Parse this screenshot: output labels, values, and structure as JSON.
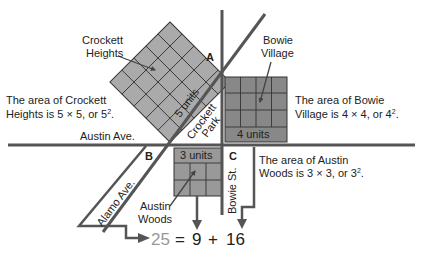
{
  "diagram": {
    "colors": {
      "road": "#555555",
      "crockett_square": "#aaaaaa",
      "bowie_square": "#888888",
      "austin_square": "#999999",
      "grid_line": "#333333",
      "equation_25": "#999999",
      "text": "#222222"
    },
    "regions": {
      "crockett_heights": {
        "name_line1": "Crockett",
        "name_line2": "Heights",
        "side_label": "5 units",
        "grid": 5
      },
      "bowie_village": {
        "name_line1": "Bowie",
        "name_line2": "Village",
        "side_label": "4 units",
        "grid": 4
      },
      "austin_woods": {
        "name_line1": "Austin",
        "name_line2": "Woods",
        "side_label": "3 units",
        "grid": 3
      },
      "crockett_park": {
        "line1": "Crockett",
        "line2": "Park"
      }
    },
    "streets": {
      "austin_ave": "Austin Ave.",
      "alamo_ave": "Alamo Ave.",
      "bowie_st": "Bowie St."
    },
    "points": {
      "a": "A",
      "b": "B",
      "c": "C"
    },
    "captions": {
      "crockett": {
        "line1": "The area of Crockett",
        "line2": "Heights is 5 × 5, or 5",
        "sup": "2",
        "end": "."
      },
      "bowie": {
        "line1": "The area of Bowie",
        "line2": "Village is 4 × 4, or 4",
        "sup": "2",
        "end": "."
      },
      "austin": {
        "line1": "The area of Austin",
        "line2": "Woods is 3 × 3, or 3",
        "sup": "2",
        "end": "."
      }
    },
    "equation": {
      "lhs": "25",
      "eq": "=",
      "a": "9",
      "plus": "+",
      "b": "16"
    }
  }
}
